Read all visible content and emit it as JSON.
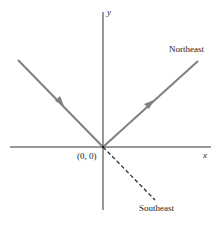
{
  "diagram": {
    "type": "coordinate-direction-diagram",
    "axes": {
      "x_label": "x",
      "y_label": "y",
      "origin_label": "(0, 0)"
    },
    "paths": [
      {
        "name": "incoming-ray",
        "style": "solid",
        "color": "#808080",
        "from": "upper-left",
        "to": "origin",
        "arrow": "mid"
      },
      {
        "name": "northeast-ray",
        "style": "solid",
        "color": "#808080",
        "from": "origin",
        "to": "upper-right",
        "arrow": "mid",
        "label": "Northeast"
      },
      {
        "name": "southeast-ray",
        "style": "dashed",
        "color": "#222222",
        "from": "origin",
        "to": "lower-right",
        "label": "Southeast"
      }
    ],
    "labels": {
      "northeast": "Northeast",
      "southeast": "Southeast"
    },
    "colors": {
      "axis": "#333333",
      "ray": "#808080",
      "dashed": "#222222"
    }
  }
}
